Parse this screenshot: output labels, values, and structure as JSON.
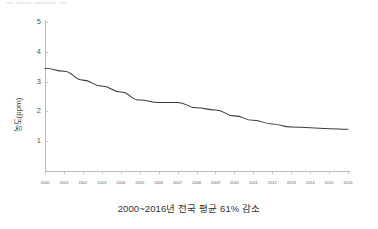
{
  "top_artifact": {
    "text": "▬  ▬▬   ▬▬▬  ▬"
  },
  "axis": {
    "y_label": "농도(ppm)",
    "y_ticks": [
      "1",
      "2",
      "3",
      "4",
      "5"
    ],
    "x_ticks": [
      "2000",
      "2001",
      "2002",
      "2003",
      "2004",
      "2005",
      "2006",
      "2007",
      "2008",
      "2009",
      "2010",
      "2011",
      "2012",
      "2013",
      "2014",
      "2015",
      "2016"
    ]
  },
  "caption": {
    "text": "2000~2016년 전국 평균 61% 감소"
  },
  "colors": {
    "line": "#3c3c3c",
    "axis": "#b9b9b9",
    "tick_text": "#6a6a6a",
    "background": "#ffffff"
  },
  "chart_data": {
    "type": "line",
    "title": "",
    "subtitle": "",
    "xlabel": "",
    "ylabel": "농도(ppm)",
    "annotation": "2000~2016년 전국 평균 61% 감소",
    "grid": false,
    "legend": false,
    "legend_position": "none",
    "xlim": [
      2000,
      2016
    ],
    "ylim": [
      0,
      5
    ],
    "yticks": [
      1,
      2,
      3,
      4,
      5
    ],
    "x": [
      2000,
      2001,
      2002,
      2003,
      2004,
      2005,
      2006,
      2007,
      2008,
      2009,
      2010,
      2011,
      2012,
      2013,
      2014,
      2015,
      2016
    ],
    "categories": [
      "2000",
      "2001",
      "2002",
      "2003",
      "2004",
      "2005",
      "2006",
      "2007",
      "2008",
      "2009",
      "2010",
      "2011",
      "2012",
      "2013",
      "2014",
      "2015",
      "2016"
    ],
    "series": [
      {
        "name": "농도(ppm)",
        "values": [
          3.45,
          3.35,
          3.05,
          2.85,
          2.65,
          2.38,
          2.3,
          2.3,
          2.12,
          2.05,
          1.85,
          1.7,
          1.58,
          1.48,
          1.45,
          1.42,
          1.4
        ]
      }
    ]
  }
}
